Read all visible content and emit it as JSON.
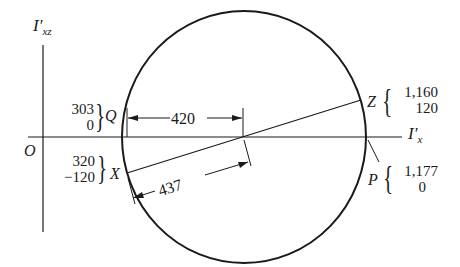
{
  "axes": {
    "vertical_label": "I′",
    "vertical_sub": "xz",
    "horizontal_label": "I′",
    "horizontal_sub": "x",
    "origin_label": "O"
  },
  "points": {
    "Q": {
      "label": "Q",
      "coord1": "303",
      "coord2": "0"
    },
    "X": {
      "label": "X",
      "coord1": "320",
      "coord2": "−120"
    },
    "Z": {
      "label": "Z",
      "coord1": "1,160",
      "coord2": "120"
    },
    "P": {
      "label": "P",
      "coord1": "1,177",
      "coord2": "0"
    }
  },
  "dimensions": {
    "center_offset": "420",
    "radius": "437"
  },
  "colors": {
    "stroke": "#1a1a1a",
    "background": "#ffffff"
  }
}
